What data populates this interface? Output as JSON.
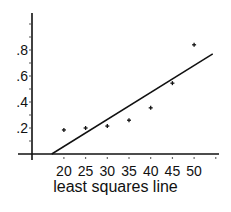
{
  "chart_data": {
    "type": "scatter",
    "title": "",
    "xlabel": "least squares line",
    "ylabel": "",
    "x_ticks": [
      20,
      25,
      30,
      35,
      40,
      45,
      50
    ],
    "x_tick_labels": [
      "20",
      "25",
      "30",
      "35",
      "40",
      "45",
      "50"
    ],
    "y_ticks": [
      0.2,
      0.4,
      0.6,
      0.8
    ],
    "y_tick_labels": [
      ".2",
      ".4",
      ".6",
      ".8"
    ],
    "xlim": [
      13,
      58
    ],
    "ylim": [
      0,
      1.1
    ],
    "grid": false,
    "legend": null,
    "series": [
      {
        "name": "data points",
        "type": "scatter",
        "x": [
          20,
          25,
          30,
          35,
          40,
          45,
          50
        ],
        "y": [
          0.185,
          0.2,
          0.215,
          0.26,
          0.355,
          0.545,
          0.84
        ]
      },
      {
        "name": "least squares line",
        "type": "line",
        "x": [
          17.2,
          54.3
        ],
        "y": [
          0.0,
          0.77
        ]
      }
    ]
  },
  "caption": "least squares line",
  "colors": {
    "ink": "#111111",
    "background": "#ffffff"
  }
}
